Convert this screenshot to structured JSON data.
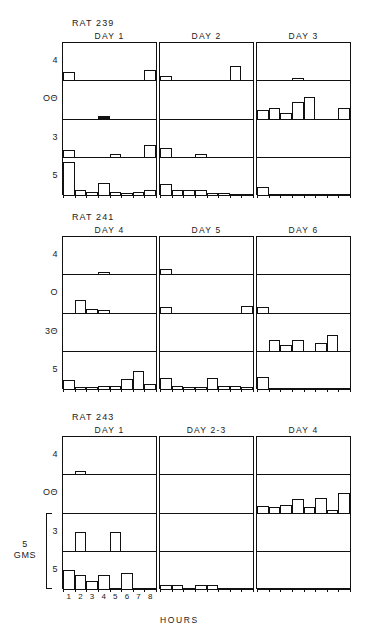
{
  "figure": {
    "x_axis_title": "HOURS",
    "x_tick_labels": [
      "1",
      "2",
      "3",
      "4",
      "5",
      "6",
      "7",
      "8"
    ],
    "scale_bracket": {
      "value": "5",
      "unit": "GMS"
    },
    "row_labels": [
      "4",
      "OΘ",
      "3",
      "5"
    ],
    "row_labels_group2": [
      "4",
      "O",
      "3Θ",
      "5"
    ],
    "row_labels_group3": [
      "4",
      "OΘ",
      "3",
      "5"
    ]
  },
  "chart_data": {
    "type": "bar",
    "title": "",
    "xlabel": "HOURS",
    "ylabel": "",
    "x": [
      1,
      2,
      3,
      4,
      5,
      6,
      7,
      8
    ],
    "xlim": [
      0.5,
      8.5
    ],
    "ylim": [
      0,
      5
    ],
    "grid": false,
    "legend": "none",
    "units": "GMS",
    "scale_reference_gms": 5,
    "panel_grid": {
      "rows": 3,
      "cols": 3
    },
    "subrow_labels": [
      "4",
      "OΘ",
      "3",
      "5"
    ],
    "groups": [
      {
        "rat": "RAT 239",
        "panels": [
          {
            "label": "DAY 1",
            "series": [
              {
                "name": "4",
                "values": [
                  0.85,
                  0,
                  0,
                  0,
                  0,
                  0,
                  0,
                  1.15
                ]
              },
              {
                "name": "OΘ",
                "values": [
                  0,
                  0,
                  0,
                  0.22,
                  0,
                  0,
                  0,
                  0
                ]
              },
              {
                "name": "3",
                "values": [
                  0.7,
                  0,
                  0,
                  0,
                  0.25,
                  0,
                  0,
                  1.3
                ]
              },
              {
                "name": "5",
                "values": [
                  3.6,
                  0.55,
                  0.3,
                  1.3,
                  0.3,
                  0.25,
                  0.3,
                  0.6
                ]
              }
            ]
          },
          {
            "label": "DAY 2",
            "series": [
              {
                "name": "4",
                "values": [
                  0.45,
                  0,
                  0,
                  0,
                  0,
                  0,
                  1.5,
                  0
                ]
              },
              {
                "name": "OΘ",
                "values": [
                  0,
                  0,
                  0,
                  0,
                  0,
                  0,
                  0,
                  0
                ]
              },
              {
                "name": "3",
                "values": [
                  1.0,
                  0,
                  0,
                  0.3,
                  0,
                  0,
                  0,
                  0
                ]
              },
              {
                "name": "5",
                "values": [
                  1.25,
                  0.5,
                  0.55,
                  0.5,
                  0.25,
                  0.25,
                  0,
                  0
                ]
              }
            ]
          },
          {
            "label": "DAY 3",
            "series": [
              {
                "name": "4",
                "values": [
                  0,
                  0,
                  0,
                  0.3,
                  0,
                  0,
                  0,
                  0
                ]
              },
              {
                "name": "OΘ",
                "values": [
                  0.9,
                  1.1,
                  0.55,
                  1.75,
                  2.3,
                  0,
                  0,
                  1.1
                ]
              },
              {
                "name": "3",
                "values": [
                  0,
                  0,
                  0,
                  0,
                  0,
                  0,
                  0,
                  0
                ]
              },
              {
                "name": "5",
                "values": [
                  0.85,
                  0,
                  0,
                  0,
                  0,
                  0,
                  0,
                  0
                ]
              }
            ]
          }
        ]
      },
      {
        "rat": "RAT 241",
        "panels": [
          {
            "label": "DAY 4",
            "series": [
              {
                "name": "4",
                "values": [
                  0,
                  0,
                  0,
                  0.28,
                  0,
                  0,
                  0,
                  0
                ]
              },
              {
                "name": "O",
                "values": [
                  0,
                  1.35,
                  0.35,
                  0.3,
                  0,
                  0,
                  0,
                  0
                ]
              },
              {
                "name": "3Θ",
                "values": [
                  0,
                  0,
                  0,
                  0,
                  0,
                  0,
                  0,
                  0
                ]
              },
              {
                "name": "5",
                "values": [
                  1.0,
                  0.25,
                  0.25,
                  0.3,
                  0.3,
                  1.1,
                  2.0,
                  0.6
                ]
              }
            ]
          },
          {
            "label": "DAY 5",
            "series": [
              {
                "name": "4",
                "values": [
                  0.55,
                  0,
                  0,
                  0,
                  0,
                  0,
                  0,
                  0
                ]
              },
              {
                "name": "O",
                "values": [
                  0.55,
                  0,
                  0,
                  0,
                  0,
                  0,
                  0,
                  0.7
                ]
              },
              {
                "name": "3Θ",
                "values": [
                  0,
                  0,
                  0,
                  0,
                  0,
                  0,
                  0,
                  0
                ]
              },
              {
                "name": "5",
                "values": [
                  1.2,
                  0.3,
                  0.25,
                  0.25,
                  1.15,
                  0.3,
                  0.3,
                  0.25
                ]
              }
            ]
          },
          {
            "label": "DAY 6",
            "series": [
              {
                "name": "4",
                "values": [
                  0,
                  0,
                  0,
                  0,
                  0,
                  0,
                  0,
                  0
                ]
              },
              {
                "name": "O",
                "values": [
                  0.55,
                  0,
                  0,
                  0,
                  0,
                  0,
                  0,
                  0
                ]
              },
              {
                "name": "3Θ",
                "values": [
                  0,
                  1.2,
                  0.65,
                  1.15,
                  0,
                  0.85,
                  1.7,
                  0
                ]
              },
              {
                "name": "5",
                "values": [
                  1.35,
                  0,
                  0,
                  0,
                  0,
                  0,
                  0,
                  0
                ]
              }
            ]
          }
        ]
      },
      {
        "rat": "RAT 243",
        "panels": [
          {
            "label": "DAY 1",
            "series": [
              {
                "name": "4",
                "values": [
                  0,
                  0.38,
                  0,
                  0,
                  0,
                  0,
                  0,
                  0
                ]
              },
              {
                "name": "OΘ",
                "values": [
                  0,
                  0,
                  0,
                  0,
                  0,
                  0,
                  0,
                  0
                ]
              },
              {
                "name": "3",
                "values": [
                  0,
                  2.0,
                  0,
                  0,
                  2.0,
                  0,
                  0,
                  0
                ]
              },
              {
                "name": "5",
                "values": [
                  2.1,
                  1.5,
                  0.9,
                  1.5,
                  0,
                  1.7,
                  0,
                  0
                ]
              }
            ]
          },
          {
            "label": "DAY 2-3",
            "series": [
              {
                "name": "4",
                "values": [
                  0,
                  0,
                  0,
                  0,
                  0,
                  0,
                  0,
                  0
                ]
              },
              {
                "name": "OΘ",
                "values": [
                  0,
                  0,
                  0,
                  0,
                  0,
                  0,
                  0,
                  0
                ]
              },
              {
                "name": "3",
                "values": [
                  0,
                  0,
                  0,
                  0,
                  0,
                  0,
                  0,
                  0
                ]
              },
              {
                "name": "5",
                "values": [
                  0.45,
                  0.45,
                  0,
                  0.45,
                  0.45,
                  0,
                  0,
                  0
                ]
              }
            ]
          },
          {
            "label": "DAY 4",
            "series": [
              {
                "name": "4",
                "values": [
                  0,
                  0,
                  0,
                  0,
                  0,
                  0,
                  0,
                  0
                ]
              },
              {
                "name": "OΘ",
                "values": [
                  0.75,
                  0.55,
                  0.85,
                  1.45,
                  0.6,
                  1.6,
                  0.3,
                  2.1
                ]
              },
              {
                "name": "3",
                "values": [
                  0,
                  0,
                  0,
                  0,
                  0,
                  0,
                  0,
                  0
                ]
              },
              {
                "name": "5",
                "values": [
                  0,
                  0,
                  0,
                  0,
                  0,
                  0,
                  0,
                  0
                ]
              }
            ]
          }
        ]
      }
    ]
  }
}
